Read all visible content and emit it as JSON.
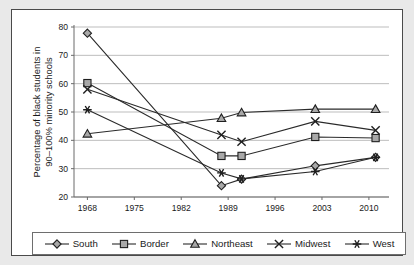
{
  "chart_data": {
    "type": "line",
    "title": "",
    "xlabel": "",
    "ylabel": "Percentage of black students in 90–100% minority schools",
    "xlim": [
      1966,
      2013
    ],
    "ylim": [
      20,
      80
    ],
    "ytick_labels": [
      "20",
      "30",
      "40",
      "50",
      "60",
      "70",
      "80"
    ],
    "ytick_values": [
      20,
      30,
      40,
      50,
      60,
      70,
      80
    ],
    "xtick_labels": [
      "1968",
      "1975",
      "1982",
      "1989",
      "1996",
      "2003",
      "2010"
    ],
    "xtick_values": [
      1968,
      1975,
      1982,
      1989,
      1996,
      2003,
      2010
    ],
    "x": [
      1968,
      1988,
      1991,
      2002,
      2011
    ],
    "grid": "horizontal",
    "legend_position": "bottom",
    "series": [
      {
        "name": "South",
        "marker": "diamond",
        "values": [
          77.8,
          24.0,
          26.3,
          31.0,
          34.0
        ]
      },
      {
        "name": "Border",
        "marker": "square",
        "values": [
          60.2,
          34.5,
          34.5,
          41.2,
          40.8
        ]
      },
      {
        "name": "Northeast",
        "marker": "triangle",
        "values": [
          42.3,
          47.8,
          49.8,
          51.0,
          51.0
        ]
      },
      {
        "name": "Midwest",
        "marker": "x",
        "values": [
          58.0,
          41.9,
          39.5,
          46.7,
          43.5
        ]
      },
      {
        "name": "West",
        "marker": "asterisk",
        "values": [
          50.8,
          28.5,
          26.4,
          29.0,
          34.0
        ]
      }
    ]
  },
  "legend": {
    "entries": [
      {
        "label": "South",
        "marker": "diamond"
      },
      {
        "label": "Border",
        "marker": "square"
      },
      {
        "label": "Northeast",
        "marker": "triangle"
      },
      {
        "label": "Midwest",
        "marker": "x"
      },
      {
        "label": "West",
        "marker": "asterisk"
      }
    ]
  },
  "colors": {
    "marker_fill": "#a8a8a8",
    "marker_stroke": "#1f1f1f",
    "line": "#2a2a2a",
    "gridline": "#b6b6b6",
    "axis": "#6a6a6a",
    "frame_border": "#4a4a4a",
    "page_background": "#e9e9e9",
    "plot_background": "#ffffff"
  }
}
